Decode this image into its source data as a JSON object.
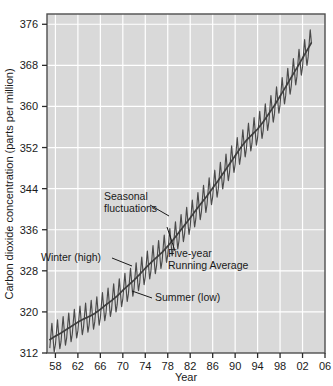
{
  "chart_data": {
    "type": "line",
    "title": "",
    "xlabel": "Year",
    "ylabel": "Carbon dioxide concentration (parts per million)",
    "xlim": [
      1956.5,
      2006
    ],
    "ylim": [
      312,
      378
    ],
    "xtick_labels": [
      "58",
      "62",
      "66",
      "70",
      "74",
      "78",
      "82",
      "86",
      "90",
      "94",
      "98",
      "02",
      "06"
    ],
    "xtick_values": [
      1958,
      1962,
      1966,
      1970,
      1974,
      1978,
      1982,
      1986,
      1990,
      1994,
      1998,
      2002,
      2006
    ],
    "ytick_labels": [
      "312",
      "320",
      "328",
      "336",
      "344",
      "352",
      "360",
      "368",
      "376"
    ],
    "ytick_values": [
      312,
      320,
      328,
      336,
      344,
      352,
      360,
      368,
      376
    ],
    "grid": true,
    "legend_position": "none",
    "plot_background": "#d9d9d9",
    "gridline_color": "#ffffff",
    "series_color": "#4a4a4a",
    "series": [
      {
        "name": "Monthly mean CO2 (seasonal fluctuations)",
        "amplitude_ppm": 6.0,
        "description": "Sawtooth annual cycle, winter/spring high and summer low, superimposed on rising trend"
      },
      {
        "name": "Five-year Running Average",
        "x": [
          1957,
          1958,
          1959,
          1960,
          1961,
          1962,
          1963,
          1964,
          1965,
          1966,
          1967,
          1968,
          1969,
          1970,
          1971,
          1972,
          1973,
          1974,
          1975,
          1976,
          1977,
          1978,
          1979,
          1980,
          1981,
          1982,
          1983,
          1984,
          1985,
          1986,
          1987,
          1988,
          1989,
          1990,
          1991,
          1992,
          1993,
          1994,
          1995,
          1996,
          1997,
          1998,
          1999,
          2000,
          2001,
          2002,
          2003,
          2004
        ],
        "values": [
          314.6,
          315.3,
          315.9,
          316.6,
          317.3,
          318.0,
          318.6,
          319.1,
          319.7,
          320.5,
          321.4,
          322.2,
          323.1,
          324.2,
          325.2,
          326.2,
          327.3,
          328.5,
          329.6,
          330.6,
          331.6,
          332.8,
          334.1,
          335.5,
          336.9,
          338.3,
          339.8,
          341.2,
          342.6,
          344.1,
          345.6,
          347.2,
          348.8,
          350.4,
          352.0,
          353.4,
          354.5,
          355.6,
          357.0,
          358.6,
          360.2,
          362.0,
          363.8,
          365.7,
          367.5,
          369.4,
          371.3,
          373.2
        ],
        "description": "Smooth rising trend line overlaid on the monthly sawtooth"
      }
    ],
    "annotations": [
      {
        "id": "seasonal-fluctuations",
        "text_lines": [
          "Seasonal",
          "fluctuations"
        ],
        "text_x": 104,
        "text_y": 200,
        "leader": "M 150 205 L 169 216"
      },
      {
        "id": "winter-high",
        "text_lines": [
          "Winter (high)"
        ],
        "text_x": 41,
        "text_y": 261,
        "leader": "M 112 258 L 132 266"
      },
      {
        "id": "five-year-running-average",
        "text_lines": [
          "Five-year",
          "Running Average"
        ],
        "text_x": 168,
        "text_y": 257,
        "leader": "M 175 251 L 167 227"
      },
      {
        "id": "summer-low",
        "text_lines": [
          "Summer (low)"
        ],
        "text_x": 155,
        "text_y": 301,
        "leader": "M 152 298 L 132 291"
      }
    ]
  }
}
